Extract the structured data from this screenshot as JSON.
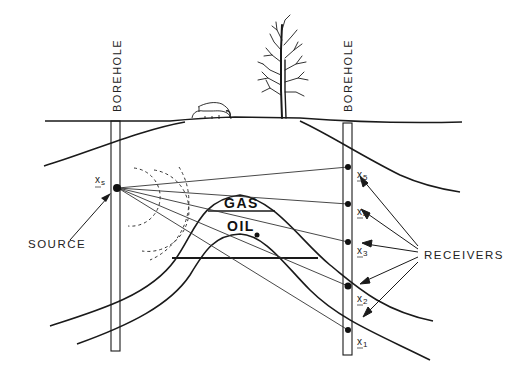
{
  "diagram": {
    "labels": {
      "left_borehole": "BOREHOLE",
      "right_borehole": "BOREHOLE",
      "gas": "GAS",
      "oil": "OIL",
      "source": "SOURCE",
      "receivers": "RECEIVERS",
      "source_symbol": "x",
      "source_subscript": "s"
    },
    "receivers": [
      {
        "symbol": "x",
        "subscript": "5"
      },
      {
        "symbol": "x",
        "subscript": "4"
      },
      {
        "symbol": "x",
        "subscript": "3"
      },
      {
        "symbol": "x",
        "subscript": "2"
      },
      {
        "symbol": "x",
        "subscript": "1"
      }
    ],
    "surface_features": [
      "cattle-grazing",
      "bare-tree"
    ],
    "colors": {
      "ink": "#1a1a1a",
      "background": "#ffffff"
    }
  }
}
